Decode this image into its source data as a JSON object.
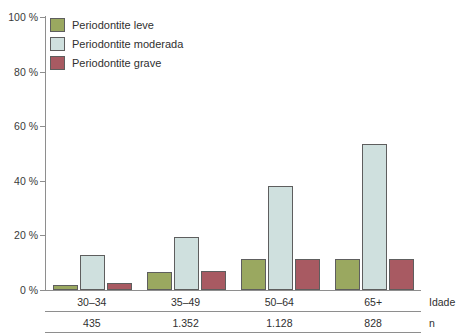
{
  "chart_data": {
    "type": "bar",
    "title": "",
    "xlabel": "Idade",
    "ylabel": "",
    "ylim": [
      0,
      100
    ],
    "grid": false,
    "legend_position": "top-left",
    "categories": [
      "30–34",
      "35–49",
      "50–64",
      "65+"
    ],
    "ytick_labels": [
      "0 %",
      "20 %",
      "40 %",
      "60 %",
      "80 %",
      "100 %"
    ],
    "ytick_values": [
      0,
      20,
      40,
      60,
      80,
      100
    ],
    "series": [
      {
        "name": "Periodontite leve",
        "color": "#9aa860",
        "values": [
          2.0,
          6.5,
          11.5,
          11.5
        ]
      },
      {
        "name": "Periodontite moderada",
        "color": "#cfe0de",
        "values": [
          13.0,
          19.5,
          38.0,
          53.5
        ]
      },
      {
        "name": "Periodontite grave",
        "color": "#a85a62",
        "values": [
          2.5,
          7.0,
          11.5,
          11.5
        ]
      }
    ],
    "annotations": {
      "age_row_label": "Idade",
      "n_row_label": "n",
      "n_values": [
        "435",
        "1.352",
        "1.128",
        "828"
      ]
    }
  }
}
